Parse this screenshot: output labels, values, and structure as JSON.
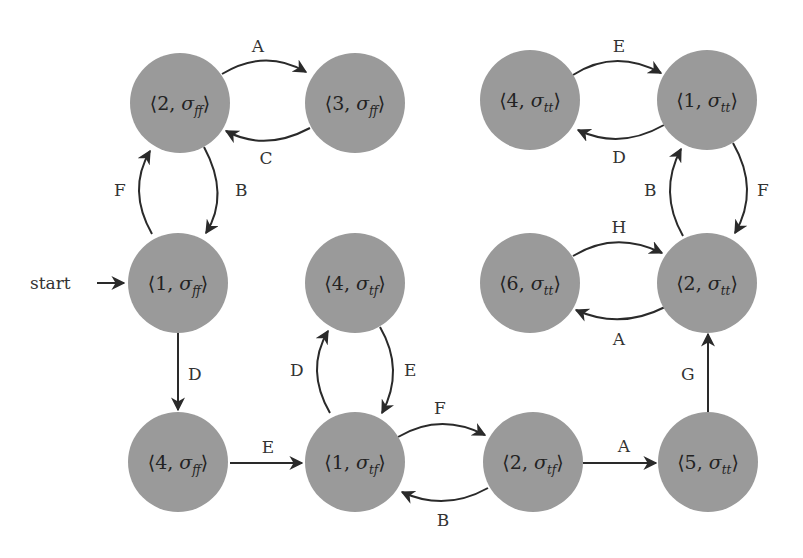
{
  "diagram": {
    "type": "state-transition-graph",
    "start_label": "start",
    "node_fill": "#9a9a9a",
    "edge_color": "#2a2a2a",
    "nodes": [
      {
        "id": "n2ff",
        "num": "2",
        "sub": "ff",
        "label": "⟨2, σ_ff⟩",
        "cx": 180,
        "cy": 103
      },
      {
        "id": "n3ff",
        "num": "3",
        "sub": "ff",
        "label": "⟨3, σ_ff⟩",
        "cx": 355,
        "cy": 103
      },
      {
        "id": "n1ff",
        "num": "1",
        "sub": "ff",
        "label": "⟨1, σ_ff⟩",
        "cx": 178,
        "cy": 283
      },
      {
        "id": "n4tf",
        "num": "4",
        "sub": "tf",
        "label": "⟨4, σ_tf⟩",
        "cx": 355,
        "cy": 283
      },
      {
        "id": "n4ff",
        "num": "4",
        "sub": "ff",
        "label": "⟨4, σ_ff⟩",
        "cx": 178,
        "cy": 462
      },
      {
        "id": "n1tf",
        "num": "1",
        "sub": "tf",
        "label": "⟨1, σ_tf⟩",
        "cx": 355,
        "cy": 462
      },
      {
        "id": "n2tf",
        "num": "2",
        "sub": "tf",
        "label": "⟨2, σ_tf⟩",
        "cx": 533,
        "cy": 462
      },
      {
        "id": "n5tt",
        "num": "5",
        "sub": "tt",
        "label": "⟨5, σ_tt⟩",
        "cx": 708,
        "cy": 462
      },
      {
        "id": "n4tt",
        "num": "4",
        "sub": "tt",
        "label": "⟨4, σ_tt⟩",
        "cx": 530,
        "cy": 100
      },
      {
        "id": "n1tt",
        "num": "1",
        "sub": "tt",
        "label": "⟨1, σ_tt⟩",
        "cx": 707,
        "cy": 100
      },
      {
        "id": "n6tt",
        "num": "6",
        "sub": "tt",
        "label": "⟨6, σ_tt⟩",
        "cx": 530,
        "cy": 283
      },
      {
        "id": "n2tt",
        "num": "2",
        "sub": "tt",
        "label": "⟨2, σ_tt⟩",
        "cx": 707,
        "cy": 283
      }
    ],
    "edges": [
      {
        "from": "n2ff",
        "to": "n3ff",
        "label": "A"
      },
      {
        "from": "n3ff",
        "to": "n2ff",
        "label": "C"
      },
      {
        "from": "n2ff",
        "to": "n1ff",
        "label": "B"
      },
      {
        "from": "n1ff",
        "to": "n2ff",
        "label": "F"
      },
      {
        "from": "n1ff",
        "to": "n4ff",
        "label": "D"
      },
      {
        "from": "n4ff",
        "to": "n1tf",
        "label": "E"
      },
      {
        "from": "n1tf",
        "to": "n4tf",
        "label": "D"
      },
      {
        "from": "n4tf",
        "to": "n1tf",
        "label": "E"
      },
      {
        "from": "n1tf",
        "to": "n2tf",
        "label": "F"
      },
      {
        "from": "n2tf",
        "to": "n1tf",
        "label": "B"
      },
      {
        "from": "n2tf",
        "to": "n5tt",
        "label": "A"
      },
      {
        "from": "n5tt",
        "to": "n2tt",
        "label": "G"
      },
      {
        "from": "n6tt",
        "to": "n2tt",
        "label": "H"
      },
      {
        "from": "n2tt",
        "to": "n6tt",
        "label": "A"
      },
      {
        "from": "n2tt",
        "to": "n1tt",
        "label": "B"
      },
      {
        "from": "n1tt",
        "to": "n2tt",
        "label": "F"
      },
      {
        "from": "n4tt",
        "to": "n1tt",
        "label": "E"
      },
      {
        "from": "n1tt",
        "to": "n4tt",
        "label": "D"
      }
    ]
  }
}
